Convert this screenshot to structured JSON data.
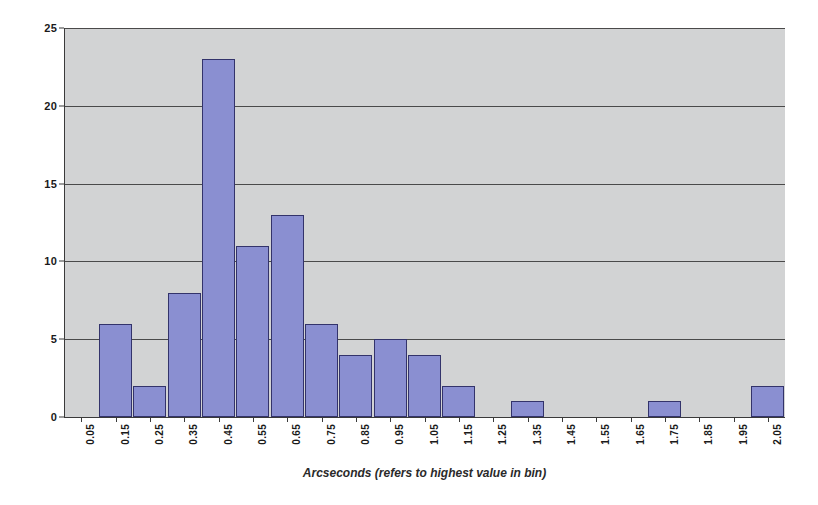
{
  "chart_data": {
    "type": "bar",
    "title": "",
    "subtitle": "",
    "xlabel": "Arcseconds (refers to highest value in bin)",
    "ylabel": "",
    "categories": [
      "0.05",
      "0.15",
      "0.25",
      "0.35",
      "0.45",
      "0.55",
      "0.65",
      "0.75",
      "0.85",
      "0.95",
      "1.05",
      "1.15",
      "1.25",
      "1.35",
      "1.45",
      "1.55",
      "1.65",
      "1.75",
      "1.85",
      "1.95",
      "2.05"
    ],
    "values": [
      0,
      6,
      2,
      8,
      23,
      11,
      13,
      6,
      4,
      5,
      4,
      2,
      0,
      1,
      0,
      0,
      0,
      1,
      0,
      0,
      2
    ],
    "ylim": [
      0,
      25
    ],
    "yticks": [
      0,
      5,
      10,
      15,
      20,
      25
    ],
    "grid": true,
    "legend": false,
    "legend_position": "none",
    "bar_color": "#8a8fd1",
    "bar_border_color": "#33336b",
    "plot_background": "#d2d3d4",
    "axis_color": "#3a3a3a"
  },
  "ghost_text": {
    "line1": "PLEASE KEEP THIS PAGE BY YOUR DESK",
    "line2": "",
    "line3": "for your reference"
  }
}
